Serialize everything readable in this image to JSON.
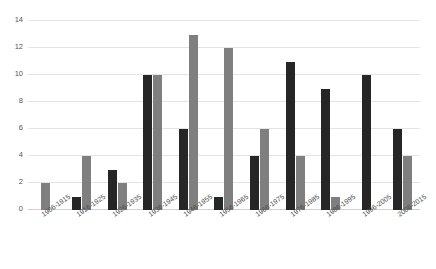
{
  "chart_data": {
    "type": "bar",
    "title": "",
    "subtitle": "",
    "xlabel": "",
    "ylabel": "",
    "ylim": [
      0,
      14
    ],
    "y_ticks": [
      0,
      2,
      4,
      6,
      8,
      10,
      12,
      14
    ],
    "grid": true,
    "legend": "none",
    "orientation": "vertical",
    "grouping": "grouped",
    "categories": [
      "1906-1915",
      "1916-1925",
      "1926-1935",
      "1936-1945",
      "1946-1955",
      "1956-1965",
      "1966-1975",
      "1976-1985",
      "1986-1995",
      "1996-2005",
      "2006-2015"
    ],
    "series": [
      {
        "name": "series-1",
        "color": "#262626",
        "values": [
          0,
          1,
          3,
          10,
          6,
          1,
          4,
          11,
          9,
          10,
          6
        ]
      },
      {
        "name": "series-2",
        "color": "#7f7f7f",
        "values": [
          2,
          4,
          2,
          10,
          13,
          12,
          6,
          4,
          1,
          0,
          4
        ]
      }
    ]
  },
  "colors": {
    "series_dark": "#262626",
    "series_gray": "#7f7f7f",
    "gridline": "#e4e4e4",
    "axis": "#d0d0d0",
    "tick_text": "#555555",
    "background": "#ffffff"
  }
}
